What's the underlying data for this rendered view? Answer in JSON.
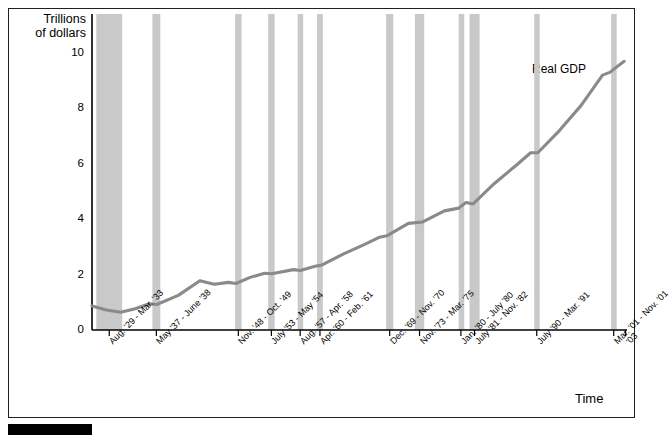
{
  "axis_title_y": "Trillions\nof dollars",
  "axis_title_x": "Time",
  "series_label": "Real GDP",
  "chart_data": {
    "type": "line",
    "title": "",
    "subtitle": "",
    "xlabel": "Time",
    "ylabel": "Trillions of dollars",
    "ylim": [
      0,
      11.2
    ],
    "yticks": [
      0,
      2,
      4,
      6,
      8,
      10
    ],
    "ytick_labels": [
      "0",
      "2",
      "4",
      "6",
      "8",
      "10"
    ],
    "grid": false,
    "legend": "none",
    "annotations": [
      {
        "text": "Real GDP",
        "x_year": 1994,
        "y_value": 8.6
      }
    ],
    "series": [
      {
        "name": "Real GDP",
        "color": "#8a8a8a",
        "x": [
          1929,
          1931,
          1933,
          1935,
          1937,
          1938,
          1941,
          1944,
          1946,
          1948,
          1949,
          1951,
          1953,
          1954,
          1957,
          1958,
          1960,
          1961,
          1964,
          1967,
          1969,
          1970,
          1973,
          1975,
          1978,
          1980,
          1981,
          1982,
          1985,
          1988,
          1990,
          1991,
          1994,
          1997,
          2000,
          2001,
          2003
        ],
        "y": [
          0.87,
          0.72,
          0.64,
          0.77,
          0.95,
          0.92,
          1.25,
          1.78,
          1.65,
          1.72,
          1.68,
          1.9,
          2.05,
          2.03,
          2.18,
          2.15,
          2.3,
          2.35,
          2.75,
          3.1,
          3.35,
          3.4,
          3.85,
          3.9,
          4.3,
          4.4,
          4.6,
          4.55,
          5.3,
          5.95,
          6.4,
          6.4,
          7.2,
          8.1,
          9.2,
          9.3,
          9.7
        ]
      }
    ],
    "recession_bands": [
      {
        "label": "Aug. '29 - Mar. '33",
        "start_year": 1929.6,
        "end_year": 1933.2
      },
      {
        "label": "May '37 - June '38",
        "start_year": 1937.4,
        "end_year": 1938.5
      },
      {
        "label": "Nov. '48 - Oct. '49",
        "start_year": 1948.9,
        "end_year": 1949.8
      },
      {
        "label": "July '53 - May '54",
        "start_year": 1953.5,
        "end_year": 1954.4
      },
      {
        "label": "Aug. '57 - Apr. '58",
        "start_year": 1957.6,
        "end_year": 1958.3
      },
      {
        "label": "Apr. '60 - Feb. '61",
        "start_year": 1960.3,
        "end_year": 1961.1
      },
      {
        "label": "Dec. '69 - Nov. '70",
        "start_year": 1969.9,
        "end_year": 1970.9
      },
      {
        "label": "Nov. '73 - Mar. '75",
        "start_year": 1973.9,
        "end_year": 1975.2
      },
      {
        "label": "Jan. '80 - July '80",
        "start_year": 1980.0,
        "end_year": 1980.6
      },
      {
        "label": "July '81 - Nov. '82",
        "start_year": 1981.5,
        "end_year": 1982.9
      },
      {
        "label": "July '90 - Mar. '91",
        "start_year": 1990.5,
        "end_year": 1991.2
      },
      {
        "label": "Mar. '01 - Nov. '01",
        "start_year": 2001.2,
        "end_year": 2001.9
      }
    ],
    "xtick_labels": [
      "Aug. '29 - Mar. '33",
      "May '37 - June '38",
      "Nov. '48 - Oct. '49",
      "July '53 - May '54",
      "Aug. '57 - Apr. '58",
      "Apr. '60 - Feb. '61",
      "Dec. '69 - Nov. '70",
      "Nov. '73 - Mar. '75",
      "Jan. '80 - July '80",
      "July '81 - Nov. '82",
      "July '90 - Mar. '91",
      "Mar. '01 - Nov. '01",
      "'03"
    ],
    "colors": {
      "line": "#8a8a8a",
      "band": "#c9c9c9",
      "axis": "#000000",
      "frame": "#231f20"
    }
  }
}
